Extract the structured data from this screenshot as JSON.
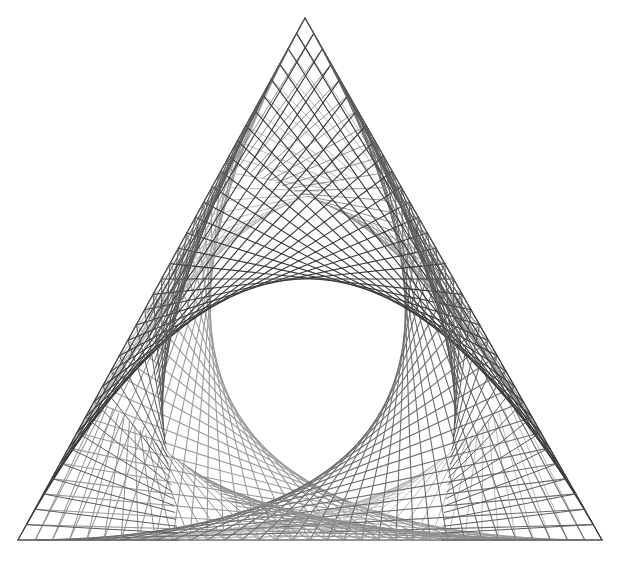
{
  "figure": {
    "canvas": {
      "width": 618,
      "height": 569,
      "background": "#ffffff"
    },
    "triangle": {
      "top": [
        305,
        18
      ],
      "bottom_left": [
        18,
        540
      ],
      "bottom_right": [
        602,
        540
      ]
    },
    "lines_per_family": 34,
    "ribbons": [
      {
        "name": "left-ribbon",
        "color_a": "#9a9a9a",
        "color_b": "#b8b8b8",
        "width": 1.1
      },
      {
        "name": "right-ribbon",
        "color_a": "#3a3a3a",
        "color_b": "#5a5a5a",
        "width": 1.1
      },
      {
        "name": "bottom-ribbon",
        "color_a": "#6e6e6e",
        "color_b": "#8e8e8e",
        "width": 1.1
      }
    ]
  }
}
